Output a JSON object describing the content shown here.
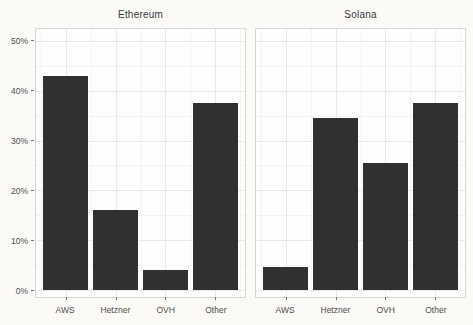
{
  "chart_data": {
    "type": "bar",
    "categories": [
      "AWS",
      "Hetzner",
      "OVH",
      "Other"
    ],
    "facets": [
      {
        "title": "Ethereum",
        "values": [
          43,
          16,
          4,
          37.5
        ]
      },
      {
        "title": "Solana",
        "values": [
          4.5,
          34.5,
          25.5,
          37.5
        ]
      }
    ],
    "y_ticks": [
      0,
      10,
      20,
      30,
      40,
      50
    ],
    "y_tick_labels": [
      "0%",
      "10%",
      "20%",
      "30%",
      "40%",
      "50%"
    ],
    "y_minor": [
      5,
      15,
      25,
      35,
      45
    ],
    "ylim": [
      -1.5,
      52.5
    ],
    "x_range": [
      0.4,
      4.6
    ],
    "x_minor": [
      0.5,
      1.5,
      2.5,
      3.5,
      4.5
    ],
    "bar_width": 0.9,
    "title": "",
    "xlabel": "",
    "ylabel": "",
    "grid": "major+minor",
    "legend": "none",
    "bar_color": "#303030",
    "major_grid_color": "#e8e8e8",
    "minor_grid_color": "#f3f3f2",
    "panel_border_color": "#d6d6d6",
    "axis_text_color": "#4d4d4d",
    "title_color": "#383838",
    "background_color": "#fbfaf7"
  }
}
